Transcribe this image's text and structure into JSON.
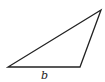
{
  "diagram": {
    "type": "triangle",
    "vertices": [
      {
        "name": "bottom-left",
        "x": 8,
        "y": 67
      },
      {
        "name": "bottom-right",
        "x": 80,
        "y": 67
      },
      {
        "name": "top-right",
        "x": 101,
        "y": 10
      }
    ],
    "stroke_color": "#222222",
    "labels": {
      "base": "b"
    }
  }
}
